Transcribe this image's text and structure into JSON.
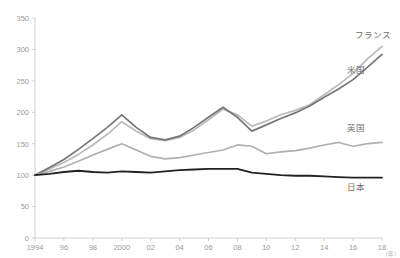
{
  "top_caption": "",
  "chart_data": {
    "type": "line",
    "title": "",
    "subtitle": "",
    "xlabel": "(年)",
    "ylabel": "",
    "xlim": [
      1994,
      2018
    ],
    "ylim": [
      0,
      350
    ],
    "grid": false,
    "legend_position": "inline-right",
    "x": [
      1994,
      1995,
      1996,
      1997,
      1998,
      1999,
      2000,
      2001,
      2002,
      2003,
      2004,
      2005,
      2006,
      2007,
      2008,
      2009,
      2010,
      2011,
      2012,
      2013,
      2014,
      2015,
      2016,
      2017,
      2018
    ],
    "xticks": [
      1994,
      1996,
      1998,
      2000,
      2002,
      2004,
      2006,
      2008,
      2010,
      2012,
      2014,
      2016,
      2018
    ],
    "xticklabels": [
      "1994",
      "96",
      "98",
      "2000",
      "02",
      "04",
      "06",
      "08",
      "10",
      "12",
      "14",
      "16",
      "18"
    ],
    "yticks": [
      0,
      50,
      100,
      150,
      200,
      250,
      300,
      350
    ],
    "yticklabels": [
      "0",
      "50",
      "100",
      "150",
      "200",
      "250",
      "300",
      "350"
    ],
    "series": [
      {
        "name": "フランス",
        "color": "#b9b9b9",
        "width": 1.7,
        "label_x": 2016.1,
        "label_y": 318,
        "values": [
          100,
          110,
          120,
          133,
          148,
          165,
          185,
          170,
          158,
          155,
          160,
          172,
          188,
          205,
          196,
          178,
          186,
          196,
          203,
          212,
          228,
          244,
          262,
          285,
          305
        ]
      },
      {
        "name": "米国",
        "color": "#767676",
        "width": 1.7,
        "label_x": 2015.6,
        "label_y": 262,
        "values": [
          100,
          112,
          125,
          141,
          158,
          176,
          196,
          176,
          160,
          156,
          162,
          176,
          192,
          208,
          192,
          170,
          180,
          190,
          199,
          210,
          224,
          237,
          252,
          272,
          292
        ]
      },
      {
        "name": "英国",
        "color": "#b0b0b0",
        "width": 1.7,
        "label_x": 2015.6,
        "label_y": 170,
        "values": [
          100,
          106,
          113,
          122,
          132,
          141,
          150,
          140,
          130,
          126,
          128,
          132,
          136,
          140,
          148,
          146,
          134,
          137,
          139,
          143,
          148,
          152,
          146,
          150,
          152
        ]
      },
      {
        "name": "日本",
        "color": "#222222",
        "width": 1.8,
        "label_x": 2015.6,
        "label_y": 77,
        "values": [
          100,
          102,
          105,
          107,
          105,
          104,
          106,
          105,
          104,
          106,
          108,
          109,
          110,
          110,
          110,
          104,
          102,
          100,
          99,
          99,
          98,
          97,
          96,
          96,
          96
        ]
      }
    ]
  }
}
